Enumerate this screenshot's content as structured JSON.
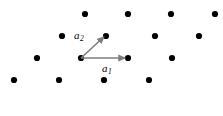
{
  "figure": {
    "type": "lattice-diagram",
    "width": 223,
    "height": 116,
    "background_color": "#ffffff",
    "point_color": "#000000",
    "vector_color": "#7d7d7d",
    "point_radius": 3.1
  },
  "labels": {
    "a1": {
      "base": "a",
      "sub": "1"
    },
    "a2": {
      "base": "a",
      "sub": "2"
    }
  },
  "chart_data": {
    "type": "scatter",
    "title": "",
    "xlabel": "",
    "ylabel": "",
    "grid": false,
    "legend": null,
    "xlim": [
      0,
      223
    ],
    "ylim": [
      116,
      0
    ],
    "lattice": {
      "origin": [
        81,
        58
      ],
      "a1_vector": [
        47,
        0
      ],
      "a2_vector": [
        25,
        -23
      ],
      "row_spacing": 23,
      "row_offset": 25,
      "column_spacing": 47
    },
    "points": [
      [
        85,
        14
      ],
      [
        128,
        14
      ],
      [
        171,
        14
      ],
      [
        215,
        14
      ],
      [
        62,
        36
      ],
      [
        106,
        36
      ],
      [
        155,
        36
      ],
      [
        199,
        36
      ],
      [
        37,
        58
      ],
      [
        81,
        58
      ],
      [
        128,
        58
      ],
      [
        172,
        58
      ],
      [
        14,
        80
      ],
      [
        59,
        80
      ],
      [
        104,
        80
      ],
      [
        149,
        80
      ]
    ],
    "annotations": [
      {
        "name": "a1",
        "text": "a₁",
        "kind": "vector-arrow",
        "start": [
          81,
          58
        ],
        "end": [
          128,
          58
        ],
        "label_position": [
          102,
          63
        ]
      },
      {
        "name": "a2",
        "text": "a₂",
        "kind": "vector-arrow",
        "start": [
          81,
          58
        ],
        "end": [
          106,
          35
        ],
        "label_position": [
          74,
          30
        ]
      }
    ]
  }
}
